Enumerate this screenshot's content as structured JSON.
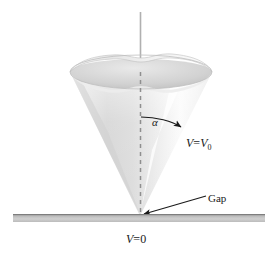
{
  "figure": {
    "background_color": "#ffffff",
    "labels": {
      "alpha": "α",
      "cone_potential_var": "V",
      "cone_potential_eq": "=",
      "cone_potential_value": "V",
      "cone_potential_subscript": "0",
      "gap": "Gap",
      "plane_potential_var": "V",
      "plane_potential_eq": "=",
      "plane_potential_value": "0"
    },
    "colors": {
      "cone_light": "#fafafa",
      "cone_mid": "#d8d8d8",
      "cone_shadow": "#b8b8b8",
      "rim_inner": "#c9c9c9",
      "plane_top": "#8d8d8d",
      "plane_body": "#bdbdbd",
      "axis_line": "#9a9a9a",
      "ink": "#1a1a1a"
    },
    "geometry": {
      "apex_x": 140,
      "apex_y": 216,
      "rim_center_x": 141,
      "rim_center_y": 72,
      "rim_radius_x": 71,
      "rim_radius_y": 17,
      "axis_top_y": 12,
      "plane_left_x": 13,
      "plane_right_x": 265,
      "plane_top_y": 214,
      "plane_height": 8,
      "half_angle_degrees": 22
    }
  }
}
